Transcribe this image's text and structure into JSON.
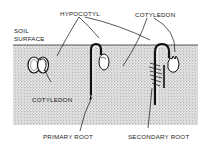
{
  "diagram": {
    "labels": {
      "hypocotyl": "HYPOCOTYL",
      "cotyledon_top": "COTYLEDON",
      "soil_surface_1": "SOIL",
      "soil_surface_2": "SURFACE",
      "cotyledon_bottom": "COTYLEDON",
      "primary_root": "PRIMARY ROOT",
      "secondary_root": "SECONDARY ROOT"
    },
    "stages": [
      {
        "name": "seed-germinating",
        "position": "left"
      },
      {
        "name": "hypocotyl-arch-emerging",
        "position": "middle"
      },
      {
        "name": "cotyledons-pulled-up",
        "position": "right"
      }
    ],
    "colors": {
      "soil_fill": "#d8d8d8",
      "ink": "#1a1a1a",
      "background": "#ffffff"
    }
  }
}
